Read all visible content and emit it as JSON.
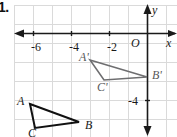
{
  "problem": {
    "number": "1."
  },
  "figure": {
    "type": "coordinate-plane-geometry"
  },
  "axes": {
    "x_label": "x",
    "y_label": "y",
    "origin_label": "O",
    "x_ticks": [
      {
        "label": "-6",
        "value": -6
      },
      {
        "label": "-4",
        "value": -4
      },
      {
        "label": "-2",
        "value": -2
      }
    ],
    "y_ticks": [
      {
        "label": "-4",
        "value": -4
      }
    ],
    "grid": true,
    "grid_color": "#d8d8d8",
    "axis_color": "#1a1a1a"
  },
  "chart_data": {
    "type": "scatter",
    "title": "",
    "xlabel": "x",
    "ylabel": "y",
    "xlim": [
      -7,
      1
    ],
    "ylim": [
      -6,
      1
    ],
    "grid": true,
    "shapes": [
      {
        "name": "triangle-ABC",
        "color": "#111111",
        "fill": "none",
        "vertices": [
          {
            "label": "A",
            "x": -6,
            "y": -4
          },
          {
            "label": "B",
            "x": -2.6,
            "y": -5
          },
          {
            "label": "C",
            "x": -5.2,
            "y": -5.3
          }
        ]
      },
      {
        "name": "triangle-A-prime-B-prime-C-prime",
        "color": "#6e6e70",
        "fill": "none",
        "vertices": [
          {
            "label": "A'",
            "x": -2.6,
            "y": -0.9
          },
          {
            "label": "B'",
            "x": 0,
            "y": -1.8
          },
          {
            "label": "C'",
            "x": -1.9,
            "y": -2.1
          }
        ]
      }
    ]
  },
  "labels": {
    "A": "A",
    "B": "B",
    "C": "C",
    "A_prime": "A'",
    "B_prime": "B'",
    "C_prime": "C'"
  }
}
